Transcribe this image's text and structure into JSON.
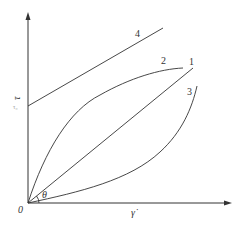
{
  "diagram": {
    "title": "",
    "x_axis": {
      "label": "γ̇",
      "origin_label": "0"
    },
    "y_axis": {
      "label": "τ",
      "intercept_label": "τ₀"
    },
    "angle_label": "θ",
    "curves": [
      {
        "id": "1",
        "label": "1",
        "shape": "straight line through origin"
      },
      {
        "id": "2",
        "label": "2",
        "shape": "concave curve through origin"
      },
      {
        "id": "3",
        "label": "3",
        "shape": "convex curve through origin"
      },
      {
        "id": "4",
        "label": "4",
        "shape": "straight line with positive y-intercept"
      }
    ],
    "stroke_color": "#333333",
    "background": "#ffffff"
  }
}
